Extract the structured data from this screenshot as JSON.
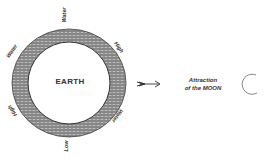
{
  "diagram": {
    "earth": {
      "label": "EARTH",
      "center": [
        69,
        83
      ],
      "outer_radius": 55,
      "inner_radius": 41,
      "ring_color": "#8a8a8a"
    },
    "water_labels": [
      {
        "text": "Water",
        "position": "top",
        "angle": -90
      },
      {
        "text": "High",
        "position": "upper-right",
        "angle": 55
      },
      {
        "text": "Water",
        "position": "lower-right",
        "angle": -55
      },
      {
        "text": "Low",
        "position": "bottom",
        "angle": -90
      },
      {
        "text": "High",
        "position": "lower-left",
        "angle": 55
      },
      {
        "text": "Water",
        "position": "upper-left",
        "angle": -55
      }
    ],
    "arrow": {
      "direction": "right",
      "from": [
        137,
        84
      ],
      "to": [
        160,
        84
      ]
    },
    "attraction_label": {
      "line1": "Attraction",
      "line2": "of the MOON"
    },
    "moon": {
      "center": [
        252,
        84
      ],
      "radius": 10
    }
  }
}
